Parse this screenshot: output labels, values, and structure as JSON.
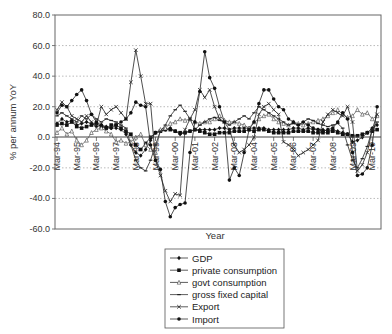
{
  "chart_data": {
    "type": "line",
    "title": "",
    "xlabel": "Year",
    "ylabel": "% per annum YoY",
    "ylim": [
      -60,
      80
    ],
    "yticks": [
      "80.0",
      "60.0",
      "40.0",
      "20.0",
      "0.0",
      "-20.0",
      "-40.0",
      "-60.0"
    ],
    "ytick_values": [
      80,
      60,
      40,
      20,
      0,
      -20,
      -40,
      -60
    ],
    "xtick_labels": [
      "Mar-94",
      "Mar-95",
      "Mar-96",
      "Mar-97",
      "Mar-98",
      "Mar-99",
      "Mar-00",
      "Mar-01",
      "Mar-02",
      "Mar-03",
      "Mar-04",
      "Mar-05",
      "Mar-06",
      "Mar-07",
      "Mar-08",
      "Mar-09",
      "Mar-10"
    ],
    "grid": "horizontal dotted",
    "legend_position": "bottom-center",
    "frequency": "quarterly",
    "x_start": "Mar-94",
    "series": [
      {
        "name": "GDP",
        "marker": "diamond",
        "values": [
          9,
          12,
          10,
          11,
          8,
          9,
          10,
          9,
          7,
          8,
          7,
          6,
          6,
          5,
          2,
          -5,
          -10,
          -12,
          -8,
          -2,
          3,
          4,
          5,
          6,
          4,
          2,
          3,
          4,
          5,
          5,
          5,
          5,
          5,
          6,
          6,
          5,
          6,
          6,
          6,
          6,
          6,
          6,
          6,
          5,
          5,
          5,
          5,
          5,
          6,
          6,
          5,
          6,
          5,
          5,
          5,
          4,
          5,
          4,
          3,
          2,
          -3,
          -2,
          0,
          3,
          6,
          8
        ]
      },
      {
        "name": "private consumption",
        "marker": "square",
        "values": [
          8,
          9,
          8,
          10,
          7,
          6,
          7,
          8,
          9,
          7,
          6,
          8,
          8,
          6,
          4,
          2,
          -5,
          -8,
          -4,
          0,
          3,
          4,
          5,
          5,
          4,
          3,
          3,
          4,
          5,
          4,
          3,
          2,
          2,
          3,
          3,
          3,
          4,
          4,
          4,
          5,
          4,
          5,
          5,
          4,
          3,
          3,
          3,
          3,
          4,
          4,
          4,
          4,
          3,
          3,
          3,
          3,
          4,
          3,
          2,
          2,
          1,
          1,
          2,
          3,
          4,
          5
        ]
      },
      {
        "name": "govt consumption",
        "marker": "triangle-open",
        "values": [
          3,
          6,
          2,
          4,
          -2,
          -5,
          -2,
          3,
          5,
          6,
          4,
          2,
          -3,
          -2,
          -4,
          -3,
          0,
          2,
          -5,
          -8,
          -10,
          5,
          6,
          9,
          10,
          12,
          11,
          12,
          10,
          9,
          10,
          10,
          12,
          14,
          11,
          10,
          10,
          9,
          8,
          6,
          10,
          12,
          14,
          15,
          12,
          10,
          9,
          8,
          10,
          9,
          8,
          9,
          10,
          11,
          12,
          14,
          16,
          18,
          15,
          13,
          14,
          18,
          15,
          16,
          12,
          14
        ]
      },
      {
        "name": "gross fixed capital",
        "marker": "dash",
        "values": [
          14,
          16,
          14,
          12,
          10,
          14,
          12,
          15,
          12,
          10,
          12,
          11,
          10,
          8,
          6,
          -5,
          -15,
          -20,
          -22,
          -15,
          -5,
          4,
          8,
          14,
          18,
          21,
          17,
          12,
          5,
          8,
          10,
          12,
          13,
          11,
          10,
          8,
          10,
          12,
          14,
          12,
          16,
          20,
          18,
          16,
          14,
          12,
          10,
          8,
          9,
          8,
          10,
          12,
          11,
          9,
          8,
          7,
          8,
          9,
          6,
          -5,
          -15,
          -20,
          -14,
          -6,
          5,
          10
        ]
      },
      {
        "name": "Export",
        "marker": "x",
        "values": [
          18,
          23,
          20,
          14,
          12,
          10,
          14,
          10,
          8,
          20,
          15,
          18,
          20,
          16,
          12,
          36,
          57,
          40,
          22,
          22,
          -15,
          -25,
          -35,
          -42,
          -37,
          -38,
          5,
          12,
          18,
          31,
          26,
          31,
          20,
          12,
          10,
          5,
          -5,
          -10,
          -8,
          -5,
          0,
          15,
          20,
          22,
          18,
          15,
          -3,
          -5,
          -8,
          -12,
          -10,
          -8,
          -5,
          -2,
          10,
          15,
          18,
          16,
          14,
          20,
          10,
          -22,
          -18,
          -10,
          5,
          15
        ]
      },
      {
        "name": "Import",
        "marker": "circle",
        "values": [
          16,
          21,
          20,
          24,
          28,
          31,
          24,
          15,
          10,
          8,
          6,
          6,
          8,
          10,
          12,
          16,
          23,
          21,
          20,
          -5,
          -15,
          -21,
          -42,
          -52,
          -46,
          -44,
          -43,
          -10,
          10,
          30,
          56,
          39,
          32,
          20,
          10,
          -28,
          -20,
          -25,
          -10,
          5,
          10,
          22,
          31,
          31,
          25,
          20,
          18,
          12,
          10,
          8,
          10,
          8,
          6,
          5,
          4,
          5,
          6,
          10,
          16,
          12,
          -10,
          -25,
          -24,
          -20,
          -5,
          20
        ]
      }
    ]
  },
  "legend": {
    "items": [
      {
        "label": "GDP"
      },
      {
        "label": "private consumption"
      },
      {
        "label": "govt consumption"
      },
      {
        "label": "gross fixed capital"
      },
      {
        "label": "Export"
      },
      {
        "label": "Import"
      }
    ]
  },
  "axes": {
    "x_title": "Year",
    "y_title": "% per annum YoY"
  }
}
